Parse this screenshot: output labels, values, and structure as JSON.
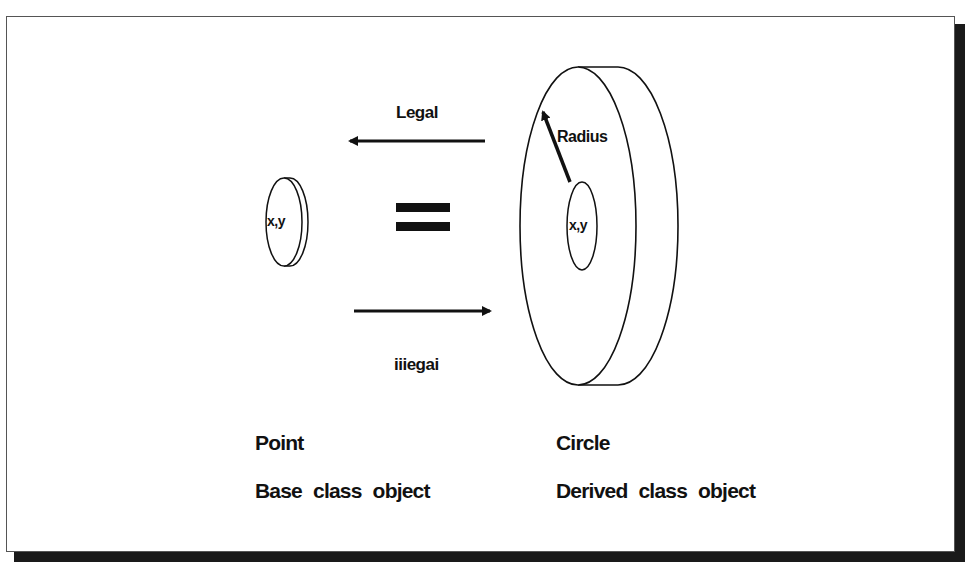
{
  "diagram": {
    "arrows": {
      "top": {
        "label": "Legal",
        "direction": "left"
      },
      "bottom": {
        "label": "iiiegai",
        "direction": "right"
      }
    },
    "equals_symbol": "=",
    "point_object": {
      "center_label": "x,y",
      "name": "Point",
      "description": "Base class object"
    },
    "circle_object": {
      "center_label": "x,y",
      "radius_label": "Radius",
      "name": "Circle",
      "description": "Derived class object"
    },
    "colors": {
      "stroke": "#111111",
      "background": "#ffffff",
      "shadow": "#1a1a1a"
    }
  }
}
